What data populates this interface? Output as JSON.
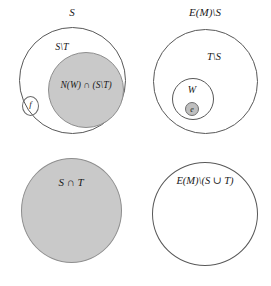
{
  "figure": {
    "type": "venn-set-diagram",
    "panels": [
      {
        "id": "top-left",
        "outer_label": "S",
        "inner_label": "S\\T",
        "shaded_label": "N(W) ∩ (S\\T)",
        "small_label": "f"
      },
      {
        "id": "top-right",
        "outer_label": "E(M)\\S",
        "inner_label": "T\\S",
        "nested_label": "W",
        "small_label": "e"
      },
      {
        "id": "bottom-left",
        "shaded_label": "S ∩ T"
      },
      {
        "id": "bottom-right",
        "outer_label": "E(M)\\(S ∪ T)"
      }
    ]
  },
  "colors": {
    "shaded_fill": "#c9c9c9",
    "stroke": "#585858",
    "shaded_stroke": "#8e8e8e",
    "text": "#1a1a1a",
    "background": "#ffffff"
  }
}
